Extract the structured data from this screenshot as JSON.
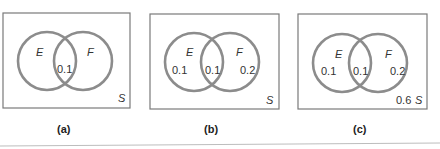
{
  "figures": [
    {
      "caption": "(a)",
      "set_e": "E",
      "set_f": "F",
      "universe": "S",
      "e_only": "",
      "intersection": "0.1",
      "f_only": "",
      "outside": ""
    },
    {
      "caption": "(b)",
      "set_e": "E",
      "set_f": "F",
      "universe": "S",
      "e_only": "0.1",
      "intersection": "0.1",
      "f_only": "0.2",
      "outside": ""
    },
    {
      "caption": "(c)",
      "set_e": "E",
      "set_f": "F",
      "universe": "S",
      "e_only": "0.1",
      "intersection": "0.1",
      "f_only": "0.2",
      "outside": "0.6"
    }
  ],
  "colors": {
    "circle_stroke": "#8c8c8c",
    "box_stroke": "#7a7a7a"
  }
}
